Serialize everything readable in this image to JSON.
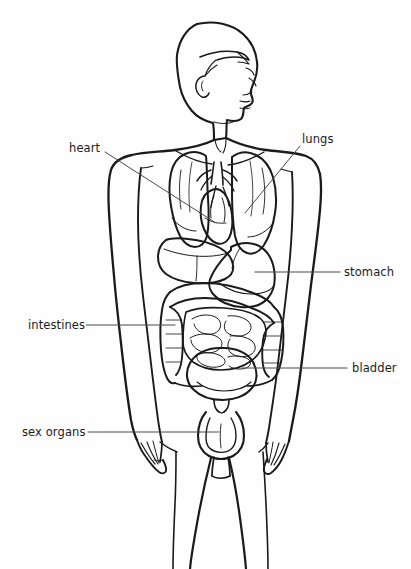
{
  "diagram": {
    "background_color": "#fefefe",
    "ink_color": "#1a1a1a",
    "leader_line_color": "#3a3a3a",
    "width": 411,
    "height": 569
  },
  "labels": [
    {
      "id": "heart",
      "text": "heart",
      "x": 69,
      "y": 142,
      "anchor_x": 105,
      "anchor_y": 152,
      "target_x": 215,
      "target_y": 223
    },
    {
      "id": "lungs",
      "text": "lungs",
      "x": 302,
      "y": 133,
      "anchor_x": 300,
      "anchor_y": 146,
      "target_x": 245,
      "target_y": 213
    },
    {
      "id": "stomach",
      "text": "stomach",
      "x": 344,
      "y": 266,
      "anchor_x": 340,
      "anchor_y": 272,
      "target_x": 255,
      "target_y": 272
    },
    {
      "id": "intestines",
      "text": "intestines",
      "x": 28,
      "y": 319,
      "anchor_x": 86,
      "anchor_y": 325,
      "target_x": 175,
      "target_y": 325
    },
    {
      "id": "bladder",
      "text": "bladder",
      "x": 352,
      "y": 362,
      "anchor_x": 347,
      "anchor_y": 368,
      "target_x": 242,
      "target_y": 368
    },
    {
      "id": "sexorgans",
      "text": "sex organs",
      "x": 22,
      "y": 426,
      "anchor_x": 88,
      "anchor_y": 432,
      "target_x": 218,
      "target_y": 432
    }
  ],
  "organs": [
    {
      "id": "lung-right",
      "name": "right lung"
    },
    {
      "id": "lung-left",
      "name": "left lung"
    },
    {
      "id": "heart",
      "name": "heart"
    },
    {
      "id": "liver",
      "name": "liver"
    },
    {
      "id": "stomach",
      "name": "stomach"
    },
    {
      "id": "colon",
      "name": "large intestine"
    },
    {
      "id": "small-intestine",
      "name": "small intestine"
    },
    {
      "id": "bladder",
      "name": "urinary bladder"
    },
    {
      "id": "sex-organs",
      "name": "sex organs"
    }
  ],
  "body_parts": [
    {
      "id": "head",
      "name": "head in profile facing right"
    },
    {
      "id": "neck",
      "name": "neck"
    },
    {
      "id": "torso",
      "name": "torso"
    },
    {
      "id": "arm-left",
      "name": "left arm"
    },
    {
      "id": "arm-right",
      "name": "right arm"
    },
    {
      "id": "leg-left",
      "name": "left leg"
    },
    {
      "id": "leg-right",
      "name": "right leg"
    }
  ]
}
